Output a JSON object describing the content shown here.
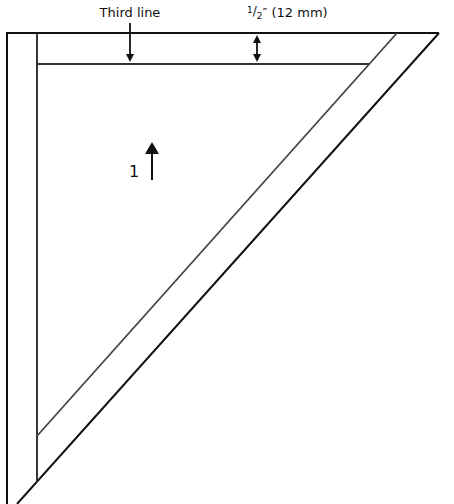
{
  "diagram": {
    "labels": {
      "third_line": "Third line",
      "seam_allowance_whole": "",
      "seam_allowance_num": "1",
      "seam_allowance_den": "2",
      "seam_allowance_rest": "″ (12 mm)",
      "step_number": "1"
    },
    "colors": {
      "line": "#111111",
      "inner_line": "#444444",
      "background": "#ffffff"
    },
    "annotations": [
      {
        "name": "third-line-arrow",
        "direction": "down"
      },
      {
        "name": "seam-allowance-arrow",
        "direction": "up-down"
      },
      {
        "name": "step-arrow",
        "direction": "up"
      }
    ]
  }
}
